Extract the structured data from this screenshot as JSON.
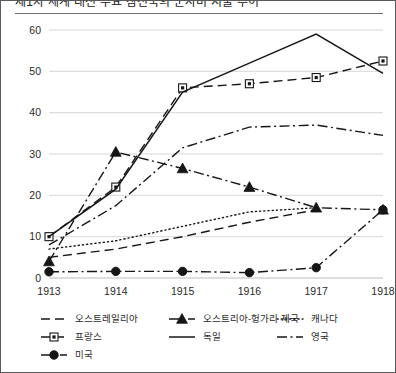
{
  "title": "제1차 세계 대전 주요 참전국의 군사비 지출 추이",
  "chart_data": {
    "type": "line",
    "title": "제1차 세계 대전 주요 참전국의 군사비 지출 추이",
    "xlabel": "",
    "ylabel": "",
    "x": [
      "1913",
      "1914",
      "1915",
      "1916",
      "1917",
      "1918"
    ],
    "categories": [
      "1913",
      "1914",
      "1915",
      "1916",
      "1917",
      "1918"
    ],
    "ylim": [
      0,
      60
    ],
    "yticks": [
      0,
      10,
      20,
      30,
      40,
      50,
      60
    ],
    "xticks": [
      "1913",
      "1914",
      "1915",
      "1916",
      "1917",
      "1918"
    ],
    "grid": true,
    "legend_position": "bottom",
    "series": [
      {
        "name": "오스트레일리아",
        "style": "dashed",
        "marker": "none",
        "values": [
          5.0,
          7.0,
          10.0,
          13.5,
          16.5,
          null
        ]
      },
      {
        "name": "오스트리아-헝가리 제국",
        "style": "dash-dot",
        "marker": "triangle",
        "values": [
          4.0,
          30.5,
          26.5,
          22.0,
          17.0,
          16.5
        ]
      },
      {
        "name": "캐나다",
        "style": "dotted",
        "marker": "none",
        "values": [
          7.0,
          9.0,
          12.5,
          16.0,
          17.0,
          null
        ]
      },
      {
        "name": "프랑스",
        "style": "dashed",
        "marker": "open-square",
        "values": [
          10.0,
          22.0,
          46.0,
          47.0,
          48.5,
          52.5
        ]
      },
      {
        "name": "독일",
        "style": "solid",
        "marker": "none",
        "values": [
          10.0,
          21.5,
          45.0,
          52.0,
          59.0,
          49.5
        ]
      },
      {
        "name": "영국",
        "style": "dash-dot",
        "marker": "none",
        "values": [
          8.0,
          17.5,
          31.5,
          36.5,
          37.0,
          34.5
        ]
      },
      {
        "name": "미국",
        "style": "dash-dot",
        "marker": "filled-circle",
        "values": [
          1.5,
          1.6,
          1.6,
          1.3,
          2.5,
          16.5
        ]
      }
    ]
  },
  "legend": {
    "rows": [
      [
        {
          "label": "오스트레일리아",
          "style": "dashed",
          "marker": "none"
        },
        {
          "label": "오스트리아-헝가리 제국",
          "style": "dash-dot",
          "marker": "triangle"
        },
        {
          "label": "캐나다",
          "style": "dotted",
          "marker": "none"
        }
      ],
      [
        {
          "label": "프랑스",
          "style": "dashed",
          "marker": "open-square"
        },
        {
          "label": "독일",
          "style": "solid",
          "marker": "none"
        },
        {
          "label": "영국",
          "style": "dash-dot",
          "marker": "none"
        }
      ],
      [
        {
          "label": "미국",
          "style": "dash-dot",
          "marker": "filled-circle"
        }
      ]
    ]
  },
  "colors": {
    "line": "#161616",
    "grid": "#d2d2d2",
    "text": "#2a2a2a",
    "border": "#5a5a5a",
    "background": "#ffffff"
  }
}
